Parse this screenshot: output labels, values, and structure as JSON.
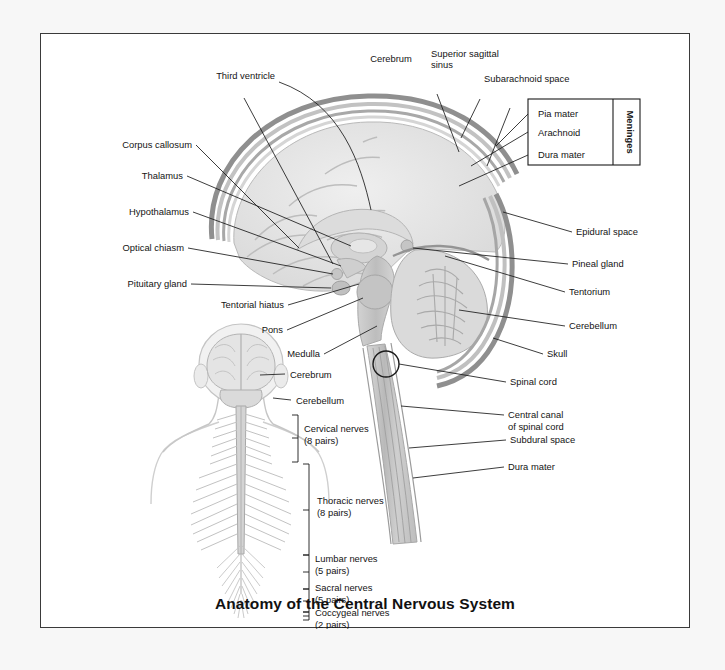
{
  "figure": {
    "title": "Anatomy of the Central Nervous System",
    "legend_box": {
      "group_label": "Meninges",
      "layers": [
        "Pia mater",
        "Arachnoid",
        "Dura mater"
      ]
    }
  },
  "sagittal_labels": {
    "top": [
      "Third ventricle",
      "Cerebrum",
      "Superior sagittal\nsinus",
      "Subarachnoid space"
    ],
    "third_ventricle": "Third ventricle",
    "cerebrum": "Cerebrum",
    "superior_sagittal_sinus_l1": "Superior sagittal",
    "superior_sagittal_sinus_l2": "sinus",
    "subarachnoid_space": "Subarachnoid space",
    "corpus_callosum": "Corpus callosum",
    "thalamus": "Thalamus",
    "hypothalamus": "Hypothalamus",
    "optical_chiasm": "Optical chiasm",
    "pituitary_gland": "Pituitary gland",
    "tentorial_hiatus": "Tentorial hiatus",
    "pons": "Pons",
    "medulla": "Medulla",
    "epidural_space": "Epidural space",
    "pineal_gland": "Pineal gland",
    "tentorium": "Tentorium",
    "cerebellum": "Cerebellum",
    "skull": "Skull",
    "spinal_cord": "Spinal cord",
    "central_canal_l1": "Central canal",
    "central_canal_l2": "of spinal cord",
    "subdural_space": "Subdural space",
    "dura_mater": "Dura mater"
  },
  "posterior_figure_labels": {
    "cerebrum": "Cerebrum",
    "cerebellum": "Cerebellum",
    "nerve_groups": [
      {
        "name": "Cervical nerves",
        "pairs": "(8 pairs)"
      },
      {
        "name": "Thoracic nerves",
        "pairs": "(8 pairs)"
      },
      {
        "name": "Lumbar nerves",
        "pairs": "(5 pairs)"
      },
      {
        "name": "Sacral nerves",
        "pairs": "(5 pairs)"
      },
      {
        "name": "Coccygeal nerves",
        "pairs": "(2 pairs)"
      }
    ],
    "cervical_name": "Cervical nerves",
    "cervical_pairs": "(8 pairs)",
    "thoracic_name": "Thoracic nerves",
    "thoracic_pairs": "(8 pairs)",
    "lumbar_name": "Lumbar nerves",
    "lumbar_pairs": "(5 pairs)",
    "sacral_name": "Sacral nerves",
    "sacral_pairs": "(5 pairs)",
    "coccygeal_name": "Coccygeal nerves",
    "coccygeal_pairs": "(2 pairs)"
  },
  "colors": {
    "page_background": "#f7f7f7",
    "plate_background": "#ffffff",
    "plate_border": "#3a3a3a",
    "ink": "#141414",
    "brain_tissue": "#e3e3e3",
    "brain_shade": "#c9c9c9",
    "brainstem": "#c2c2c2",
    "meninges_layer": "#b4b4b4",
    "cord": "#cdcdcd"
  }
}
